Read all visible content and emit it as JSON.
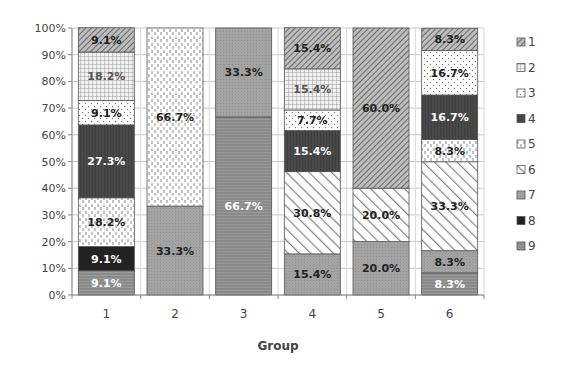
{
  "chart_data": {
    "type": "bar",
    "stacked": "percent",
    "title": "",
    "xlabel": "Group",
    "ylabel": "",
    "ylim": [
      0,
      100
    ],
    "y_ticks": [
      "0%",
      "10%",
      "20%",
      "30%",
      "40%",
      "50%",
      "60%",
      "70%",
      "80%",
      "90%",
      "100%"
    ],
    "categories": [
      "1",
      "2",
      "3",
      "4",
      "5",
      "6"
    ],
    "grid": true,
    "legend_position": "right",
    "series": [
      {
        "name": "1",
        "pattern": "diag-fine",
        "values": [
          9.1,
          0,
          0,
          15.4,
          60.0,
          8.3
        ],
        "label_color": "#222"
      },
      {
        "name": "2",
        "pattern": "grid",
        "values": [
          18.2,
          0,
          0,
          15.4,
          0,
          0
        ],
        "label_color": "#555"
      },
      {
        "name": "3",
        "pattern": "dots",
        "values": [
          9.1,
          0,
          0,
          7.7,
          0,
          16.7
        ],
        "label_color": "#222"
      },
      {
        "name": "4",
        "pattern": "dark",
        "values": [
          27.3,
          0,
          0,
          15.4,
          0,
          16.7
        ],
        "label_color": "#ffffff"
      },
      {
        "name": "5",
        "pattern": "vdash",
        "values": [
          18.2,
          66.7,
          0,
          0,
          0,
          8.3
        ],
        "label_color": "#222"
      },
      {
        "name": "6",
        "pattern": "diag-wide",
        "values": [
          0,
          0,
          0,
          30.8,
          20.0,
          33.3
        ],
        "label_color": "#222"
      },
      {
        "name": "7",
        "pattern": "gray",
        "values": [
          0,
          33.3,
          33.3,
          15.4,
          20.0,
          8.3
        ],
        "label_color": "#222"
      },
      {
        "name": "8",
        "pattern": "black",
        "values": [
          9.1,
          0,
          0,
          0,
          0,
          0
        ],
        "label_color": "#ffffff"
      },
      {
        "name": "9",
        "pattern": "hlines",
        "values": [
          9.1,
          0,
          66.7,
          0,
          0,
          8.3
        ],
        "label_color": "#ffffff"
      }
    ],
    "data_labels": [
      [
        "9.1%",
        "18.2%",
        "9.1%",
        "27.3%",
        "18.2%",
        "",
        "",
        "9.1%",
        "9.1%"
      ],
      [
        "",
        "",
        "",
        "",
        "66.7%",
        "",
        "33.3%",
        "",
        ""
      ],
      [
        "",
        "",
        "",
        "",
        "",
        "",
        "33.3%",
        "",
        "66.7%"
      ],
      [
        "15.4%",
        "15.4%",
        "7.7%",
        "15.4%",
        "",
        "30.8%",
        "15.4%",
        "",
        ""
      ],
      [
        "60.0%",
        "",
        "",
        "",
        "",
        "20.0%",
        "20.0%",
        "",
        ""
      ],
      [
        "8.3%",
        "",
        "16.7%",
        "16.7%",
        "8.3%",
        "33.3%",
        "8.3%",
        "",
        "8.3%"
      ]
    ]
  }
}
